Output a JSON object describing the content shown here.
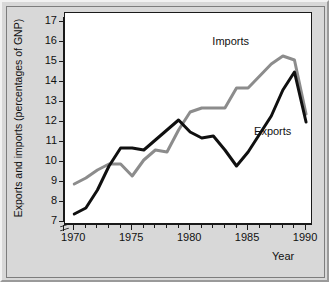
{
  "chart_data": {
    "type": "line",
    "title": "",
    "xlabel": "Year",
    "ylabel": "Exports and imports (percentages of GNP)",
    "xlim": [
      1969.2,
      1990.6
    ],
    "ylim": [
      6.85,
      17.45
    ],
    "xticks": [
      1970,
      1975,
      1980,
      1985,
      1990
    ],
    "xtick_labels": [
      "1970",
      "1975",
      "1980",
      "1985",
      "1990"
    ],
    "xminorticks": [
      1971,
      1972,
      1973,
      1974,
      1976,
      1977,
      1978,
      1979,
      1981,
      1982,
      1983,
      1984,
      1986,
      1987,
      1988,
      1989
    ],
    "yticks": [
      7,
      8,
      9,
      10,
      11,
      12,
      13,
      14,
      15,
      16,
      17
    ],
    "ytick_labels": [
      "7",
      "8",
      "9",
      "10",
      "11",
      "12",
      "13",
      "14",
      "15",
      "16",
      "17"
    ],
    "axis_break": true,
    "grid": false,
    "legend_position": "inline-annotation",
    "x": [
      1970,
      1971,
      1972,
      1973,
      1974,
      1975,
      1976,
      1977,
      1978,
      1979,
      1980,
      1981,
      1982,
      1983,
      1984,
      1985,
      1986,
      1987,
      1988,
      1989,
      1990
    ],
    "series": [
      {
        "name": "Imports",
        "color": "#8c8c8c",
        "values": [
          8.9,
          9.2,
          9.6,
          9.9,
          9.9,
          9.3,
          10.1,
          10.6,
          10.5,
          11.6,
          12.5,
          12.7,
          12.7,
          12.7,
          13.7,
          13.7,
          14.3,
          14.9,
          15.3,
          15.1,
          12.4
        ]
      },
      {
        "name": "Exports",
        "color": "#101010",
        "values": [
          7.4,
          7.7,
          8.6,
          9.8,
          10.7,
          10.7,
          10.6,
          11.1,
          11.6,
          12.1,
          11.5,
          11.2,
          11.3,
          10.6,
          9.8,
          10.5,
          11.4,
          12.3,
          13.6,
          14.5,
          12.0
        ]
      }
    ],
    "annotations": [
      {
        "text": "Imports",
        "x": 1982.0,
        "y": 15.9
      },
      {
        "text": "Exports",
        "x": 1985.6,
        "y": 11.4
      }
    ]
  }
}
